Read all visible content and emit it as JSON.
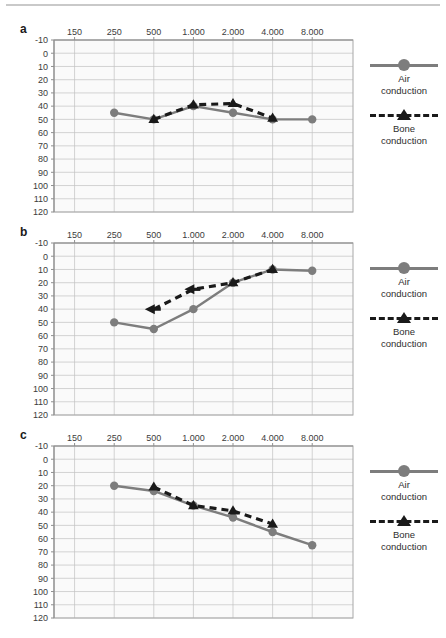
{
  "figure": {
    "panels": [
      "a",
      "b",
      "c"
    ],
    "legend": {
      "air_label": "Air\nconduction",
      "air_label_line1": "Air",
      "air_label_line2": "conduction",
      "bone_label_line1": "Bone",
      "bone_label_line2": "conduction",
      "air_color": "#7d7d7d",
      "bone_color": "#1a1a1a",
      "grid_color": "#c2c2c2",
      "plot_bg": "#fafafa"
    }
  },
  "chart_data": [
    {
      "type": "line",
      "panel": "a",
      "title": "a",
      "xlabel": "",
      "ylabel": "",
      "x_tick_labels": [
        "150",
        "250",
        "500",
        "1.000",
        "2.000",
        "4.000",
        "8.000"
      ],
      "x_tick_values": [
        150,
        250,
        500,
        1000,
        2000,
        4000,
        8000
      ],
      "y_tick_labels": [
        "-10",
        "0",
        "10",
        "20",
        "30",
        "40",
        "50",
        "60",
        "70",
        "80",
        "90",
        "100",
        "110",
        "120"
      ],
      "ylim": [
        -10,
        120
      ],
      "y_inverted": true,
      "grid": true,
      "legend_position": "right",
      "series": [
        {
          "name": "Air conduction",
          "marker": "circle",
          "linestyle": "solid",
          "color": "#7d7d7d",
          "x": [
            250,
            500,
            1000,
            2000,
            4000,
            8000
          ],
          "values": [
            45,
            50,
            40,
            45,
            50,
            50
          ]
        },
        {
          "name": "Bone conduction",
          "marker": "triangle",
          "linestyle": "dashed",
          "color": "#1a1a1a",
          "x": [
            500,
            1000,
            2000,
            4000
          ],
          "values": [
            50,
            39,
            38,
            49
          ]
        }
      ]
    },
    {
      "type": "line",
      "panel": "b",
      "title": "b",
      "xlabel": "",
      "ylabel": "",
      "x_tick_labels": [
        "150",
        "250",
        "500",
        "1.000",
        "2.000",
        "4.000",
        "8.000"
      ],
      "x_tick_values": [
        150,
        250,
        500,
        1000,
        2000,
        4000,
        8000
      ],
      "y_tick_labels": [
        "-10",
        "0",
        "10",
        "20",
        "30",
        "40",
        "50",
        "60",
        "70",
        "80",
        "90",
        "100",
        "110",
        "120"
      ],
      "ylim": [
        -10,
        120
      ],
      "y_inverted": true,
      "grid": true,
      "legend_position": "right",
      "series": [
        {
          "name": "Air conduction",
          "marker": "circle",
          "linestyle": "solid",
          "color": "#7d7d7d",
          "x": [
            250,
            500,
            1000,
            2000,
            4000,
            8000
          ],
          "values": [
            50,
            55,
            40,
            20,
            10,
            11
          ]
        },
        {
          "name": "Bone conduction",
          "marker": "triangle",
          "linestyle": "dashed",
          "color": "#1a1a1a",
          "x": [
            500,
            1000,
            2000,
            4000
          ],
          "values": [
            40,
            25,
            20,
            10
          ],
          "marker_overrides": [
            "arrow-left",
            "arrow-left",
            "triangle",
            "triangle"
          ],
          "note": "no-response arrows at 500 Hz and 1.000 Hz"
        }
      ]
    },
    {
      "type": "line",
      "panel": "c",
      "title": "c",
      "xlabel": "",
      "ylabel": "",
      "x_tick_labels": [
        "150",
        "250",
        "500",
        "1.000",
        "2.000",
        "4.000",
        "8.000"
      ],
      "x_tick_values": [
        150,
        250,
        500,
        1000,
        2000,
        4000,
        8000
      ],
      "y_tick_labels": [
        "-10",
        "0",
        "10",
        "20",
        "30",
        "40",
        "50",
        "60",
        "70",
        "80",
        "90",
        "100",
        "110",
        "120"
      ],
      "ylim": [
        -10,
        120
      ],
      "y_inverted": true,
      "grid": true,
      "legend_position": "right",
      "series": [
        {
          "name": "Air conduction",
          "marker": "circle",
          "linestyle": "solid",
          "color": "#7d7d7d",
          "x": [
            250,
            500,
            1000,
            2000,
            4000,
            8000
          ],
          "values": [
            20,
            24,
            35,
            44,
            55,
            65
          ]
        },
        {
          "name": "Bone conduction",
          "marker": "triangle",
          "linestyle": "dashed",
          "color": "#1a1a1a",
          "x": [
            500,
            1000,
            2000,
            4000
          ],
          "values": [
            21,
            35,
            39,
            49
          ]
        }
      ]
    }
  ]
}
